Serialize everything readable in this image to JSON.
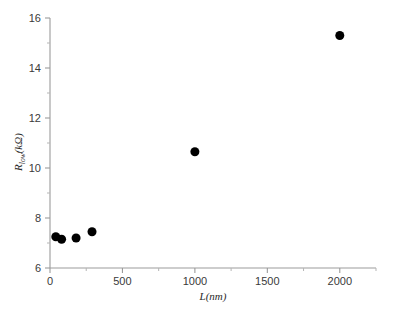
{
  "figure": {
    "background": "#ffffff",
    "marker_color": "#000000",
    "axis_color": "#9b9b9b",
    "text_color": "#3a3a3a"
  },
  "axes": {
    "y_title_main": "R",
    "y_title_sub": "low",
    "y_title_unit": "(kΩ)",
    "x_title": "L(nm)",
    "y_ticks": [
      "6",
      "8",
      "10",
      "12",
      "14",
      "16"
    ],
    "x_ticks": [
      "0",
      "500",
      "1000",
      "1500",
      "2000"
    ]
  },
  "chart_data": {
    "type": "scatter",
    "title": "",
    "xlabel": "L(nm)",
    "ylabel": "R_low(kΩ)",
    "xlim": [
      0,
      2250
    ],
    "ylim": [
      6,
      16
    ],
    "xticks": [
      0,
      500,
      1000,
      1500,
      2000
    ],
    "yticks": [
      6,
      8,
      10,
      12,
      14,
      16
    ],
    "xminor": [
      250,
      750,
      1250,
      1750,
      2250
    ],
    "yminor": [
      7,
      9,
      11,
      13,
      15
    ],
    "grid": false,
    "legend": null,
    "marker": "filled-circle",
    "marker_size_px": 9,
    "series": [
      {
        "name": "R_low",
        "x": [
          40,
          80,
          180,
          290,
          1000,
          2000
        ],
        "y": [
          7.25,
          7.15,
          7.2,
          7.45,
          10.65,
          15.3
        ]
      }
    ]
  }
}
